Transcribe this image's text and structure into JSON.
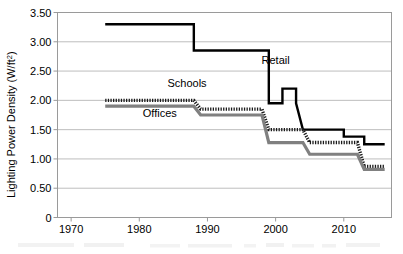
{
  "chart_data": {
    "type": "line",
    "title": "",
    "subtitle": "",
    "xlabel": "",
    "ylabel": "Lighting Power Density (W/ft",
    "ylabel_superscript": "2",
    "ylabel_suffix": ")",
    "xlim": [
      1968,
      2017
    ],
    "ylim": [
      0,
      3.5
    ],
    "grid": true,
    "grid_axis": "y",
    "legend_position": "inline-annotations",
    "xticks": [
      1970,
      1980,
      1990,
      2000,
      2010
    ],
    "xtick_labels": [
      "1970",
      "1980",
      "1990",
      "2000",
      "2010"
    ],
    "yticks": [
      0,
      0.5,
      1.0,
      1.5,
      2.0,
      2.5,
      3.0,
      3.5
    ],
    "ytick_labels": [
      "0",
      "0.50",
      "1.00",
      "1.50",
      "2.00",
      "2.50",
      "3.00",
      "3.50"
    ],
    "series": [
      {
        "name": "Retail",
        "style": "solid-black-thick",
        "color": "#000000",
        "label_x": 2000,
        "label_y": 2.62,
        "x": [
          1975,
          1988,
          1988,
          1999,
          1999,
          2001,
          2001,
          2003,
          2003,
          2004,
          2004,
          2010,
          2010,
          2013,
          2013,
          2016
        ],
        "y": [
          3.3,
          3.3,
          2.85,
          2.85,
          1.95,
          1.95,
          2.2,
          2.2,
          1.95,
          1.5,
          1.5,
          1.5,
          1.38,
          1.38,
          1.25,
          1.25
        ],
        "values_by_year": [
          {
            "year": 1975,
            "value": 3.3
          },
          {
            "year": 1988,
            "value": 3.3
          },
          {
            "year": 1989,
            "value": 2.85
          },
          {
            "year": 1999,
            "value": 1.95
          },
          {
            "year": 2001,
            "value": 2.2
          },
          {
            "year": 2004,
            "value": 1.5
          },
          {
            "year": 2010,
            "value": 1.38
          },
          {
            "year": 2013,
            "value": 1.25
          },
          {
            "year": 2016,
            "value": 1.25
          }
        ]
      },
      {
        "name": "Schools",
        "style": "dotted-black-thick",
        "color": "#1a1a1a",
        "label_x": 1987,
        "label_y": 2.22,
        "x": [
          1975,
          1988,
          1989,
          1998,
          1999,
          2004,
          2005,
          2012,
          2013,
          2016
        ],
        "y": [
          2.0,
          2.0,
          1.85,
          1.85,
          1.5,
          1.5,
          1.28,
          1.28,
          0.87,
          0.87
        ],
        "values_by_year": [
          {
            "year": 1975,
            "value": 2.0
          },
          {
            "year": 1988,
            "value": 2.0
          },
          {
            "year": 1989,
            "value": 1.85
          },
          {
            "year": 1998,
            "value": 1.85
          },
          {
            "year": 1999,
            "value": 1.5
          },
          {
            "year": 2004,
            "value": 1.5
          },
          {
            "year": 2005,
            "value": 1.28
          },
          {
            "year": 2012,
            "value": 1.28
          },
          {
            "year": 2013,
            "value": 0.87
          },
          {
            "year": 2016,
            "value": 0.87
          }
        ]
      },
      {
        "name": "Offices",
        "style": "solid-gray-thick",
        "color": "#808080",
        "label_x": 1983,
        "label_y": 1.72,
        "x": [
          1975,
          1988,
          1989,
          1998,
          1999,
          2004,
          2005,
          2012,
          2013,
          2016
        ],
        "y": [
          1.9,
          1.9,
          1.75,
          1.75,
          1.28,
          1.28,
          1.08,
          1.08,
          0.82,
          0.82
        ],
        "values_by_year": [
          {
            "year": 1975,
            "value": 1.9
          },
          {
            "year": 1988,
            "value": 1.9
          },
          {
            "year": 1989,
            "value": 1.75
          },
          {
            "year": 1998,
            "value": 1.75
          },
          {
            "year": 1999,
            "value": 1.28
          },
          {
            "year": 2004,
            "value": 1.28
          },
          {
            "year": 2005,
            "value": 1.08
          },
          {
            "year": 2012,
            "value": 1.08
          },
          {
            "year": 2013,
            "value": 0.82
          },
          {
            "year": 2016,
            "value": 0.82
          }
        ]
      }
    ]
  },
  "figure": {
    "caption_partial": ""
  },
  "colors": {
    "background": "#ffffff",
    "grid": "#b5b5b5",
    "frame": "#9a9a9a",
    "retail": "#000000",
    "schools": "#1a1a1a",
    "offices": "#808080",
    "text": "#000000"
  }
}
